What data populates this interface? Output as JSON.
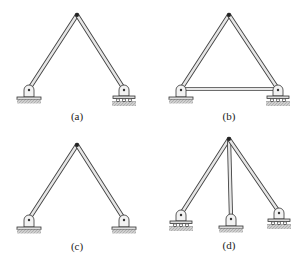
{
  "figures": [
    {
      "id": "a",
      "label": "(a)",
      "label_pos": [
        77,
        110
      ],
      "supports": {
        "left": "pin",
        "right": "roller"
      },
      "tie_bar": false
    },
    {
      "id": "b",
      "label": "(b)",
      "label_pos": [
        229,
        110
      ],
      "supports": {
        "left": "pin",
        "right": "roller"
      },
      "tie_bar": true
    },
    {
      "id": "c",
      "label": "(c)",
      "label_pos": [
        77,
        240
      ],
      "supports": {
        "left": "pin",
        "right": "pin"
      },
      "tie_bar": false
    },
    {
      "id": "d",
      "label": "(d)",
      "label_pos": [
        229,
        239
      ],
      "supports": {
        "left": "roller",
        "center": "pin",
        "right": "roller"
      },
      "tie_bar": false
    }
  ],
  "colors": {
    "member_fill": "#e6e6e6",
    "member_stroke": "#444444",
    "ground": "#b8b8b8",
    "ink": "#222222"
  }
}
